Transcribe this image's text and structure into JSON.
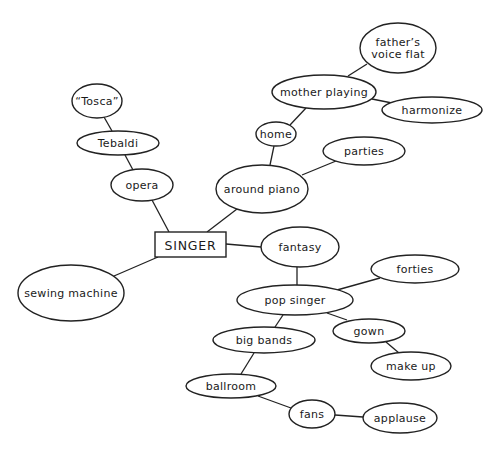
{
  "diagram": {
    "type": "mind-map",
    "width": 499,
    "height": 452,
    "colors": {
      "stroke": "#222222",
      "background": "#ffffff",
      "text": "#1a1a1a"
    },
    "root": {
      "id": "singer",
      "label": "SINGER",
      "shape": "rect",
      "x": 155,
      "y": 232,
      "w": 71,
      "h": 25
    },
    "nodes": [
      {
        "id": "tosca",
        "lines": [
          "“Tosca”"
        ],
        "cx": 97,
        "cy": 101,
        "rx": 25,
        "ry": 17
      },
      {
        "id": "tebaldi",
        "lines": [
          "Tebaldi"
        ],
        "cx": 118,
        "cy": 143,
        "rx": 41,
        "ry": 12
      },
      {
        "id": "opera",
        "lines": [
          "opera"
        ],
        "cx": 142,
        "cy": 185,
        "rx": 31,
        "ry": 16
      },
      {
        "id": "around-piano",
        "lines": [
          "around piano"
        ],
        "cx": 262,
        "cy": 189,
        "rx": 46,
        "ry": 24
      },
      {
        "id": "home",
        "lines": [
          "home"
        ],
        "cx": 276,
        "cy": 134,
        "rx": 20,
        "ry": 12
      },
      {
        "id": "mother-playing",
        "lines": [
          "mother playing"
        ],
        "cx": 324,
        "cy": 92,
        "rx": 52,
        "ry": 17
      },
      {
        "id": "fathers-voice-flat",
        "lines": [
          "father’s",
          "voice flat"
        ],
        "cx": 398,
        "cy": 48,
        "rx": 38,
        "ry": 25
      },
      {
        "id": "harmonize",
        "lines": [
          "harmonize"
        ],
        "cx": 432,
        "cy": 110,
        "rx": 50,
        "ry": 13
      },
      {
        "id": "parties",
        "lines": [
          "parties"
        ],
        "cx": 364,
        "cy": 151,
        "rx": 41,
        "ry": 14
      },
      {
        "id": "fantasy",
        "lines": [
          "fantasy"
        ],
        "cx": 300,
        "cy": 247,
        "rx": 39,
        "ry": 20
      },
      {
        "id": "sewing-machine",
        "lines": [
          "sewing machine"
        ],
        "cx": 71,
        "cy": 293,
        "rx": 53,
        "ry": 28
      },
      {
        "id": "forties",
        "lines": [
          "forties"
        ],
        "cx": 415,
        "cy": 269,
        "rx": 44,
        "ry": 14
      },
      {
        "id": "pop-singer",
        "lines": [
          "pop singer"
        ],
        "cx": 295,
        "cy": 300,
        "rx": 58,
        "ry": 15
      },
      {
        "id": "gown",
        "lines": [
          "gown"
        ],
        "cx": 369,
        "cy": 331,
        "rx": 36,
        "ry": 12
      },
      {
        "id": "big-bands",
        "lines": [
          "big bands"
        ],
        "cx": 264,
        "cy": 340,
        "rx": 51,
        "ry": 13
      },
      {
        "id": "make-up",
        "lines": [
          "make up"
        ],
        "cx": 411,
        "cy": 366,
        "rx": 40,
        "ry": 14
      },
      {
        "id": "ballroom",
        "lines": [
          "ballroom"
        ],
        "cx": 231,
        "cy": 386,
        "rx": 45,
        "ry": 12
      },
      {
        "id": "fans",
        "lines": [
          "fans"
        ],
        "cx": 312,
        "cy": 414,
        "rx": 23,
        "ry": 14
      },
      {
        "id": "applause",
        "lines": [
          "applause"
        ],
        "cx": 400,
        "cy": 418,
        "rx": 37,
        "ry": 15
      }
    ],
    "edges": [
      {
        "from": "singer",
        "to": "opera",
        "x1": 169,
        "y1": 232,
        "x2": 152,
        "y2": 200
      },
      {
        "from": "opera",
        "to": "tebaldi",
        "x1": 133,
        "y1": 170,
        "x2": 125,
        "y2": 155
      },
      {
        "from": "tebaldi",
        "to": "tosca",
        "x1": 112,
        "y1": 131,
        "x2": 104,
        "y2": 117
      },
      {
        "from": "singer",
        "to": "around-piano",
        "x1": 207,
        "y1": 232,
        "x2": 237,
        "y2": 209
      },
      {
        "from": "around-piano",
        "to": "home",
        "x1": 270,
        "y1": 165,
        "x2": 274,
        "y2": 146
      },
      {
        "from": "home",
        "to": "mother-playing",
        "x1": 290,
        "y1": 125,
        "x2": 306,
        "y2": 108
      },
      {
        "from": "mother-playing",
        "to": "fathers-voice-flat",
        "x1": 348,
        "y1": 76,
        "x2": 367,
        "y2": 64
      },
      {
        "from": "mother-playing",
        "to": "harmonize",
        "x1": 372,
        "y1": 99,
        "x2": 392,
        "y2": 103
      },
      {
        "from": "around-piano",
        "to": "parties",
        "x1": 302,
        "y1": 175,
        "x2": 336,
        "y2": 161
      },
      {
        "from": "singer",
        "to": "fantasy",
        "x1": 226,
        "y1": 244,
        "x2": 261,
        "y2": 247
      },
      {
        "from": "singer",
        "to": "sewing-machine",
        "x1": 158,
        "y1": 257,
        "x2": 114,
        "y2": 276
      },
      {
        "from": "fantasy",
        "to": "pop-singer",
        "x1": 297,
        "y1": 267,
        "x2": 297,
        "y2": 285
      },
      {
        "from": "pop-singer",
        "to": "forties",
        "x1": 337,
        "y1": 290,
        "x2": 380,
        "y2": 278
      },
      {
        "from": "pop-singer",
        "to": "gown",
        "x1": 327,
        "y1": 313,
        "x2": 347,
        "y2": 320
      },
      {
        "from": "pop-singer",
        "to": "big-bands",
        "x1": 283,
        "y1": 315,
        "x2": 275,
        "y2": 327
      },
      {
        "from": "gown",
        "to": "make-up",
        "x1": 386,
        "y1": 342,
        "x2": 399,
        "y2": 353
      },
      {
        "from": "big-bands",
        "to": "ballroom",
        "x1": 254,
        "y1": 353,
        "x2": 241,
        "y2": 374
      },
      {
        "from": "ballroom",
        "to": "fans",
        "x1": 258,
        "y1": 396,
        "x2": 291,
        "y2": 408
      },
      {
        "from": "fans",
        "to": "applause",
        "x1": 335,
        "y1": 415,
        "x2": 363,
        "y2": 417
      }
    ]
  }
}
